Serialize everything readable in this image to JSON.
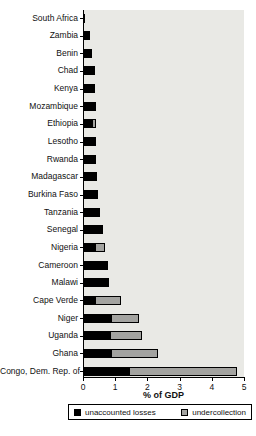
{
  "chart_data": {
    "type": "bar",
    "orientation": "horizontal",
    "stacked": true,
    "title": "",
    "xlabel": "% of GDP",
    "xlim": [
      0,
      5
    ],
    "xticks": [
      0,
      1,
      2,
      3,
      4,
      5
    ],
    "plot_background": "#e9e9e5",
    "legend_position": "bottom",
    "categories": [
      "South Africa",
      "Zambia",
      "Benin",
      "Chad",
      "Kenya",
      "Mozambique",
      "Ethiopia",
      "Lesotho",
      "Rwanda",
      "Madagascar",
      "Burkina Faso",
      "Tanzania",
      "Senegal",
      "Nigeria",
      "Cameroon",
      "Malawi",
      "Cape Verde",
      "Niger",
      "Uganda",
      "Ghana",
      "Congo, Dem. Rep. of"
    ],
    "series": [
      {
        "name": "unaccounted losses",
        "color": "#000000",
        "values": [
          0.02,
          0.2,
          0.25,
          0.33,
          0.35,
          0.36,
          0.24,
          0.36,
          0.37,
          0.39,
          0.45,
          0.5,
          0.6,
          0.34,
          0.75,
          0.7,
          0.35,
          0.85,
          0.8,
          0.85,
          1.4
        ]
      },
      {
        "name": "undercollection",
        "color": "#a3a3a0",
        "values": [
          0,
          0,
          0,
          0,
          0,
          0,
          0.14,
          0,
          0,
          0,
          0,
          0,
          0,
          0.31,
          0,
          0.08,
          0.8,
          0.85,
          1.0,
          1.45,
          3.35
        ]
      }
    ]
  },
  "legend": {
    "items": [
      {
        "label": "unaccounted losses",
        "color": "#000000"
      },
      {
        "label": "undercollection",
        "color": "#a3a3a0"
      }
    ]
  }
}
